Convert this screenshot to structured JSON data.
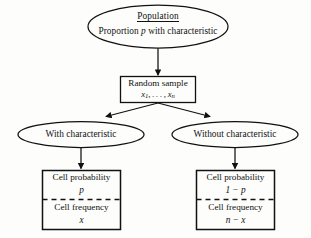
{
  "diagram": {
    "type": "flowchart",
    "background_color": "#fdfdfc",
    "stroke_color": "#111111",
    "nodes": [
      {
        "id": "population",
        "shape": "ellipse",
        "line1": "Population",
        "line1_underlined": true,
        "line2_prefix": "Proportion ",
        "line2_italic": "p",
        "line2_suffix": " with characteristic"
      },
      {
        "id": "random-sample",
        "shape": "rectangle",
        "line1": "Random sample",
        "line2_prefix": "x",
        "line2_sub1": "1",
        "line2_mid": ", . . . , x",
        "line2_sub2": "n"
      },
      {
        "id": "with-characteristic",
        "shape": "ellipse",
        "label": "With characteristic"
      },
      {
        "id": "without-characteristic",
        "shape": "ellipse",
        "label": "Without characteristic"
      },
      {
        "id": "cell-left",
        "shape": "rectangle-divided",
        "prob_label": "Cell probability",
        "prob_value": "p",
        "freq_label": "Cell frequency",
        "freq_value": "x"
      },
      {
        "id": "cell-right",
        "shape": "rectangle-divided",
        "prob_label": "Cell probability",
        "prob_value": "1 − p",
        "freq_label": "Cell frequency",
        "freq_value": "n − x"
      }
    ],
    "edges": [
      {
        "from": "population",
        "to": "random-sample",
        "style": "arrow-vertical"
      },
      {
        "from": "random-sample",
        "to": "with-characteristic",
        "style": "arrow-diagonal-left"
      },
      {
        "from": "random-sample",
        "to": "without-characteristic",
        "style": "arrow-diagonal-right"
      },
      {
        "from": "with-characteristic",
        "to": "cell-left",
        "style": "arrow-vertical"
      },
      {
        "from": "without-characteristic",
        "to": "cell-right",
        "style": "arrow-vertical"
      }
    ]
  }
}
